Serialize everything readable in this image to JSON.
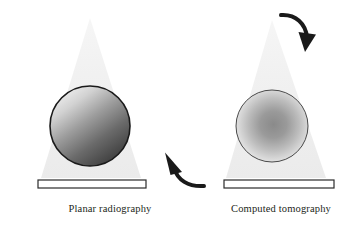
{
  "figure": {
    "background_color": "#ffffff",
    "width": 359,
    "height": 229,
    "panels": [
      {
        "id": "planar-radiography",
        "caption": "Planar radiography",
        "caption_x": 110,
        "caption_y": 212,
        "beam": {
          "name": "x-ray-beam-cone",
          "apex_x": 90,
          "apex_y": 18,
          "base_left_x": 41,
          "base_right_x": 141,
          "base_y": 178,
          "fill_color": "#f0f0f0"
        },
        "object": {
          "name": "sphere-linear-shading",
          "center_x": 90,
          "center_y": 126,
          "radius": 40,
          "gradient_type": "linear",
          "gradient_light_color": "#e8e8e8",
          "gradient_dark_color": "#3b3b3b",
          "outline_color": "#1a1a1a",
          "outline_width": 1.6
        },
        "detector": {
          "name": "detector-bar",
          "x": 38,
          "y": 180,
          "width": 108,
          "height": 8,
          "fill_color": "#ffffff",
          "outline_color": "#2b2b2b"
        }
      },
      {
        "id": "computed-tomography",
        "caption": "Computed tomography",
        "caption_x": 281,
        "caption_y": 212,
        "beam": {
          "name": "x-ray-beam-cone",
          "apex_x": 272,
          "apex_y": 20,
          "base_left_x": 226,
          "base_right_x": 326,
          "base_y": 178,
          "fill_color": "#f0f0f0"
        },
        "object": {
          "name": "sphere-radial-shading",
          "center_x": 272,
          "center_y": 126,
          "radius": 36,
          "gradient_type": "radial",
          "gradient_center_color": "#8d8d8d",
          "gradient_edge_color": "#f2f2f2",
          "outline_color": "#4a4a4a",
          "outline_width": 1.0
        },
        "detector": {
          "name": "detector-bar",
          "x": 224,
          "y": 180,
          "width": 110,
          "height": 8,
          "fill_color": "#ffffff",
          "outline_color": "#2b2b2b"
        }
      }
    ],
    "arrows": [
      {
        "id": "rotation-arrow-top",
        "label": "curved-arrow-clockwise-top-right",
        "color": "#1a1a1a",
        "stroke_width": 4,
        "path": "M 281 15 C 296 14 306 24 307 38",
        "head_points": "299,33 316,35 306,51",
        "direction": "down"
      },
      {
        "id": "rotation-arrow-bottom",
        "label": "curved-arrow-counterclockwise-bottom-left",
        "color": "#1a1a1a",
        "stroke_width": 4,
        "path": "M 203 186 C 187 187 176 179 173 166",
        "head_points": "181,170 164,152 170,173",
        "direction": "up-left"
      }
    ]
  }
}
